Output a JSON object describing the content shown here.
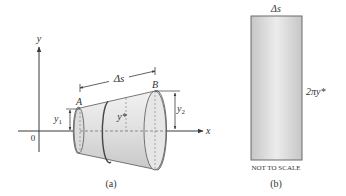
{
  "figure_a": {
    "axis_x_label": "x",
    "axis_y_label": "y",
    "origin_label": "0",
    "point_a_label": "A",
    "point_b_label": "B",
    "arc_length_label": "Δs",
    "left_radius_label": "y",
    "left_radius_sub": "1",
    "right_radius_label": "y",
    "right_radius_sub": "2",
    "mid_radius_label": "y*",
    "caption": "(a)"
  },
  "figure_b": {
    "width_label": "Δs",
    "height_label": "2πy*",
    "note": "NOT TO SCALE",
    "caption": "(b)"
  },
  "colors": {
    "line": "#3a3a3a",
    "surface_light": "#ececec",
    "surface_dark": "#c9c9c9",
    "text": "#333333"
  }
}
